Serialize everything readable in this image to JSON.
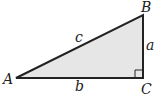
{
  "diagram": {
    "vertices": {
      "A": {
        "label": "A",
        "x": 16,
        "y": 78
      },
      "B": {
        "label": "B",
        "x": 143,
        "y": 15
      },
      "C": {
        "label": "C",
        "x": 143,
        "y": 78
      }
    },
    "sides": {
      "a": {
        "label": "a",
        "between": [
          "B",
          "C"
        ]
      },
      "b": {
        "label": "b",
        "between": [
          "A",
          "C"
        ]
      },
      "c": {
        "label": "c",
        "between": [
          "A",
          "B"
        ]
      }
    },
    "right_angle_at": "C",
    "colors": {
      "fill": "#e6e6e6",
      "stroke": "#222222"
    }
  }
}
